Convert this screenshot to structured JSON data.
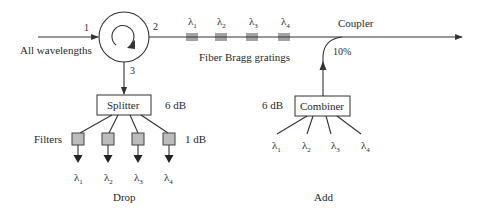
{
  "diagram": {
    "input_label": "All wavelengths",
    "circulator": {
      "port1": "1",
      "port2": "2",
      "port3": "3"
    },
    "gratings": {
      "label": "Fiber Bragg gratings",
      "wavelengths": [
        {
          "symbol": "λ",
          "sub": "1"
        },
        {
          "symbol": "λ",
          "sub": "2"
        },
        {
          "symbol": "λ",
          "sub": "3"
        },
        {
          "symbol": "λ",
          "sub": "4"
        }
      ]
    },
    "coupler": {
      "label": "Coupler",
      "ratio": "10%"
    },
    "drop": {
      "splitter_label": "Splitter",
      "splitter_loss": "6 dB",
      "filters_label": "Filters",
      "filter_loss": "1 dB",
      "outputs": [
        {
          "symbol": "λ",
          "sub": "1"
        },
        {
          "symbol": "λ",
          "sub": "2"
        },
        {
          "symbol": "λ",
          "sub": "3"
        },
        {
          "symbol": "λ",
          "sub": "4"
        }
      ],
      "section_label": "Drop"
    },
    "add": {
      "combiner_label": "Combiner",
      "combiner_loss": "6 dB",
      "inputs": [
        {
          "symbol": "λ",
          "sub": "1"
        },
        {
          "symbol": "λ",
          "sub": "2"
        },
        {
          "symbol": "λ",
          "sub": "3"
        },
        {
          "symbol": "λ",
          "sub": "4"
        }
      ],
      "section_label": "Add"
    },
    "colors": {
      "line": "#333333",
      "filter_fill": "#bcbcbc",
      "text": "#2a2a2a"
    }
  }
}
